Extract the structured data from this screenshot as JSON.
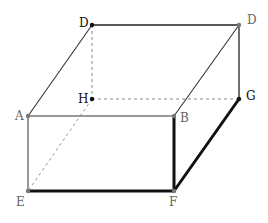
{
  "diagram": {
    "type": "cuboid",
    "points": {
      "D_left": {
        "label": "D",
        "x": 92,
        "y": 25,
        "lx": 79,
        "ly": 27,
        "color": "#111111"
      },
      "D_right": {
        "label": "D",
        "x": 239,
        "y": 25,
        "lx": 247,
        "ly": 24,
        "color": "#777777"
      },
      "H": {
        "label": "H",
        "x": 92,
        "y": 99,
        "lx": 78,
        "ly": 103,
        "color": "#111111"
      },
      "G": {
        "label": "G",
        "x": 239,
        "y": 99,
        "lx": 246,
        "ly": 100,
        "color": "#111111"
      },
      "A": {
        "label": "A",
        "x": 28,
        "y": 116,
        "lx": 15,
        "ly": 120,
        "color": "#777777"
      },
      "B": {
        "label": "B",
        "x": 174,
        "y": 116,
        "lx": 180,
        "ly": 122,
        "color": "#777777"
      },
      "E": {
        "label": "E",
        "x": 28,
        "y": 191,
        "lx": 16,
        "ly": 206,
        "color": "#777777"
      },
      "F": {
        "label": "F",
        "x": 174,
        "y": 191,
        "lx": 169,
        "ly": 206,
        "color": "#777777"
      }
    },
    "edges_solid": [
      {
        "from": "D_left",
        "to": "D_right",
        "width": 1.3,
        "color": "#222222"
      },
      {
        "from": "A",
        "to": "D_left",
        "width": 1.1,
        "color": "#333333"
      },
      {
        "from": "D_right",
        "to": "B",
        "width": 1.1,
        "color": "#333333"
      },
      {
        "from": "D_right",
        "to": "G",
        "width": 1.3,
        "color": "#222222"
      },
      {
        "from": "A",
        "to": "B",
        "width": 1.3,
        "color": "#777777"
      },
      {
        "from": "A",
        "to": "E",
        "width": 1.5,
        "color": "#777777"
      }
    ],
    "edges_bold": [
      {
        "from": "B",
        "to": "F",
        "width": 3,
        "color": "#111111"
      },
      {
        "from": "E",
        "to": "F",
        "width": 3,
        "color": "#111111"
      },
      {
        "from": "F",
        "to": "G",
        "width": 3,
        "color": "#111111"
      }
    ],
    "edges_hidden": [
      {
        "from": "D_left",
        "to": "H",
        "color": "#888888"
      },
      {
        "from": "H",
        "to": "G",
        "color": "#888888"
      },
      {
        "from": "H",
        "to": "E",
        "color": "#999999"
      }
    ]
  }
}
